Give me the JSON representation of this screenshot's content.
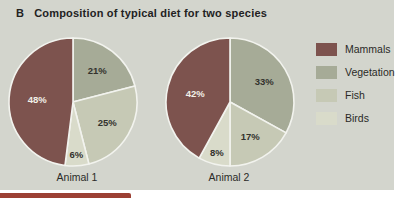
{
  "figure": {
    "section_label": "B",
    "title": "Composition of typical diet for two species"
  },
  "legend": {
    "position": "right",
    "items": [
      {
        "label": "Mammals",
        "color": "#7d534e"
      },
      {
        "label": "Vegetation",
        "color": "#a6ab97"
      },
      {
        "label": "Fish",
        "color": "#c6c9b5"
      },
      {
        "label": "Birds",
        "color": "#d9dbca"
      }
    ]
  },
  "chart_data": [
    {
      "type": "pie",
      "title": "Animal 1",
      "categories": [
        "Vegetation",
        "Fish",
        "Birds",
        "Mammals"
      ],
      "values": [
        21,
        25,
        6,
        48
      ],
      "unit": "%",
      "rotation": "clockwise from 12 o'clock",
      "colors": [
        "#a6ab97",
        "#c6c9b5",
        "#d9dbca",
        "#7d534e"
      ],
      "label_colors": [
        "#33322d",
        "#33322d",
        "#33322d",
        "#f2f0e8"
      ]
    },
    {
      "type": "pie",
      "title": "Animal 2",
      "categories": [
        "Vegetation",
        "Fish",
        "Birds",
        "Mammals"
      ],
      "values": [
        33,
        17,
        8,
        42
      ],
      "unit": "%",
      "rotation": "clockwise from 12 o'clock",
      "colors": [
        "#a6ab97",
        "#c6c9b5",
        "#d9dbca",
        "#7d534e"
      ],
      "label_colors": [
        "#33322d",
        "#33322d",
        "#33322d",
        "#f2f0e8"
      ]
    }
  ],
  "colors": {
    "page_bg": "#ffffff",
    "panel_bg": "#d3d5cd",
    "slice_border": "#f2f3ee",
    "bottom_bar": "#9c4034",
    "text": "#22221f"
  }
}
